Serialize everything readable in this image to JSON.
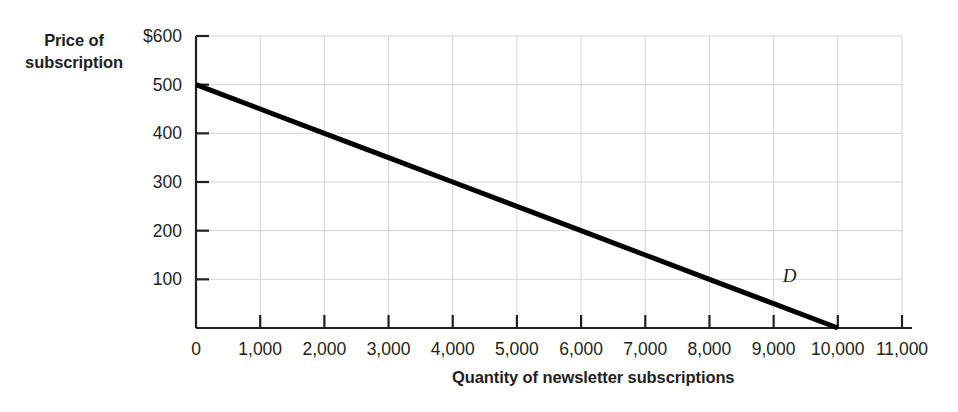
{
  "chart_data": {
    "type": "line",
    "title": "",
    "xlabel": "Quantity of newsletter subscriptions",
    "ylabel": "Price of subscription",
    "ylabel_line1": "Price of",
    "ylabel_line2": "subscription",
    "xlim": [
      0,
      11000
    ],
    "ylim": [
      0,
      600
    ],
    "grid": true,
    "legend": "none",
    "x_ticks": [
      0,
      1000,
      2000,
      3000,
      4000,
      5000,
      6000,
      7000,
      8000,
      9000,
      10000,
      11000
    ],
    "x_tick_labels": [
      "0",
      "1,000",
      "2,000",
      "3,000",
      "4,000",
      "5,000",
      "6,000",
      "7,000",
      "8,000",
      "9,000",
      "10,000",
      "11,000"
    ],
    "y_ticks": [
      100,
      200,
      300,
      400,
      500,
      600
    ],
    "y_tick_labels": [
      "100",
      "200",
      "300",
      "400",
      "500",
      "$600"
    ],
    "series": [
      {
        "name": "D",
        "label": "D",
        "color": "#000000",
        "x": [
          0,
          1000,
          2000,
          3000,
          4000,
          5000,
          6000,
          7000,
          8000,
          9000,
          10000
        ],
        "values": [
          500,
          450,
          400,
          350,
          300,
          250,
          200,
          150,
          100,
          50,
          0
        ],
        "annotation": "D",
        "annotation_x": 9250,
        "annotation_y": 95
      }
    ],
    "colors": {
      "curve": "#000000",
      "axis": "#231f20",
      "grid": "#d4d4d4",
      "text": "#231f20",
      "background": "#ffffff"
    }
  }
}
